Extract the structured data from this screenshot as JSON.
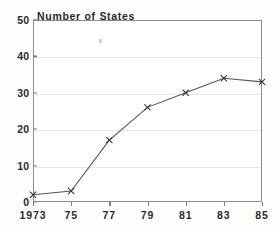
{
  "chart_data": {
    "type": "line",
    "title": "Number of States",
    "xlabel": "",
    "ylabel": "",
    "x": [
      "1973",
      "75",
      "77",
      "79",
      "81",
      "83",
      "85"
    ],
    "categories": [
      "1973",
      "75",
      "77",
      "79",
      "81",
      "83",
      "85"
    ],
    "values": [
      2,
      3,
      17,
      26,
      30,
      34,
      33
    ],
    "series": [
      {
        "name": "Number of States",
        "values": [
          2,
          3,
          17,
          26,
          30,
          34,
          33
        ]
      }
    ],
    "ylim": [
      0,
      50
    ],
    "ytick_labels": [
      "0",
      "10",
      "20",
      "30",
      "40",
      "50"
    ],
    "ytick_values": [
      0,
      10,
      20,
      30,
      40,
      50
    ],
    "xtick_labels": [
      "1973",
      "75",
      "77",
      "79",
      "81",
      "83",
      "85"
    ],
    "grid": "horizontal",
    "legend": "none",
    "marker": "x",
    "line_color": "#555555",
    "marker_color": "#333333",
    "grid_color": "#e6e6e6",
    "axis_color": "#8a8a8a",
    "text_color": "#2b2b2b"
  },
  "artifacts": {
    "speck_label": "scan-speck"
  }
}
